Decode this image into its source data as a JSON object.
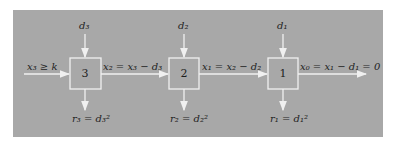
{
  "diagram": {
    "input_label": "x₃ ≥ k",
    "output_label": "x₀ = x₁ − d₁ = 0",
    "colors": {
      "panel": "#a8a8a8",
      "lines": "#f0f0f0",
      "text": "#1e1e1e"
    },
    "stages": [
      {
        "number": "3",
        "top_input": "d₃",
        "bottom_output": "r₃ = d₃²",
        "flow_out": "x₂ = x₃ − d₃"
      },
      {
        "number": "2",
        "top_input": "d₂",
        "bottom_output": "r₂ = d₂²",
        "flow_out": "x₁ = x₂ − d₂"
      },
      {
        "number": "1",
        "top_input": "d₁",
        "bottom_output": "r₁ = d₁²",
        "flow_out": "x₀ = x₁ − d₁ = 0"
      }
    ]
  }
}
